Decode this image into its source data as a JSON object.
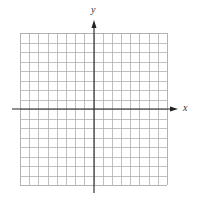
{
  "diagram": {
    "type": "coordinate-plane",
    "grid": {
      "columns": 16,
      "rows": 16,
      "line_color": "#b0b0b0",
      "border_color": "#a0a0a0"
    },
    "axes": {
      "color": "#222222",
      "x_label": "x",
      "y_label": "y",
      "x_arrow": "right",
      "y_arrow": "up"
    },
    "geometry": {
      "grid_left": 20,
      "grid_top": 33,
      "grid_right": 167,
      "grid_bottom": 185,
      "origin_x": 94,
      "origin_y": 109,
      "x_axis_start": 12,
      "x_axis_end": 178,
      "y_axis_start": 20,
      "y_axis_end": 193
    }
  }
}
